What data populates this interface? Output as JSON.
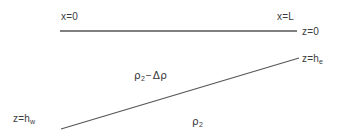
{
  "figure": {
    "type": "schematic-diagram",
    "width": 347,
    "height": 140,
    "background_color": "#ffffff",
    "line_color": "#555555",
    "text_color": "#3b3b3b"
  },
  "labels": {
    "x_origin": {
      "text": "x=0",
      "x": 61,
      "y": 12
    },
    "x_length": {
      "text": "x=L",
      "x": 277,
      "y": 12
    },
    "z_origin": {
      "text": "z=0",
      "x": 302,
      "y": 27
    },
    "z_east": {
      "base": "z=h",
      "sub": "e",
      "x": 302,
      "y": 54
    },
    "z_west": {
      "base": "z=h",
      "sub": "w",
      "x": 13,
      "y": 114
    },
    "density_upper": {
      "base": "ρ",
      "sub": "2",
      "op": "−",
      "delta": "Δρ",
      "x": 134,
      "y": 70
    },
    "density_lower": {
      "base": "ρ",
      "sub": "2",
      "x": 192,
      "y": 116
    }
  },
  "lines": {
    "surface": {
      "name": "z=0 horizontal surface line",
      "x1": 60,
      "y1": 31,
      "x2": 297,
      "y2": 31,
      "color": "#555555",
      "width": 1.6
    },
    "interface": {
      "name": "sloping density interface",
      "x1": 61,
      "y1": 129,
      "x2": 299,
      "y2": 58,
      "color": "#555555",
      "width": 1.2
    }
  }
}
